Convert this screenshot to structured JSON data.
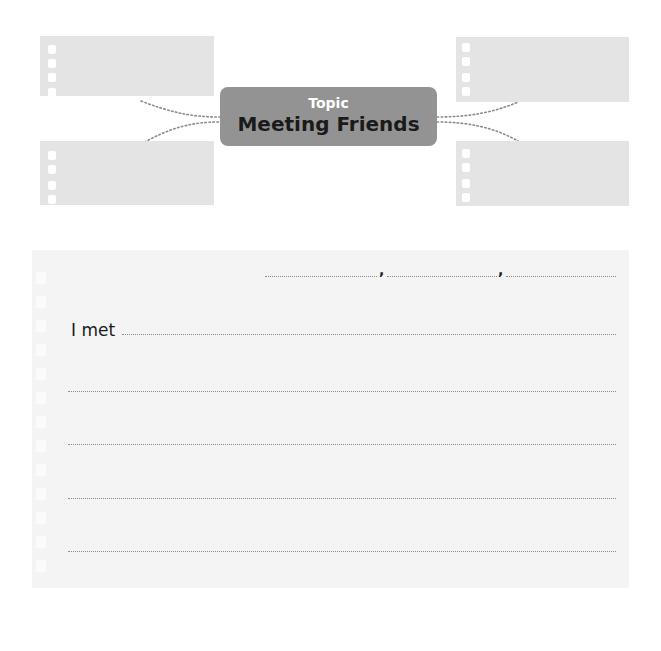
{
  "topic": {
    "label": "Topic",
    "title": "Meeting Friends"
  },
  "mindmap": {
    "notes": [
      {
        "position": "top-left",
        "text": ""
      },
      {
        "position": "bottom-left",
        "text": ""
      },
      {
        "position": "top-right",
        "text": ""
      },
      {
        "position": "bottom-right",
        "text": ""
      }
    ]
  },
  "writing": {
    "blanks_row": {
      "separator_1": ",",
      "separator_2": ","
    },
    "sentence_start": "I met",
    "lines": [
      "",
      "",
      "",
      ""
    ]
  },
  "colors": {
    "topic_box": "#939393",
    "note_paper": "#e4e4e4",
    "writing_paper": "#f4f4f4"
  }
}
